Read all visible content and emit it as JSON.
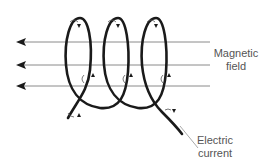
{
  "diagram": {
    "type": "solenoid-magnetic-field",
    "labels": {
      "magnetic_field": [
        "Magnetic",
        "field"
      ],
      "electric_current": [
        "Electric",
        "current"
      ]
    },
    "field_lines": 3,
    "field_direction": "left",
    "coil_turns": 3,
    "colors": {
      "wire": "#1a1a1a",
      "field_line": "#8a8a8a",
      "label_text": "#555555",
      "leader_line": "#aaaaaa"
    }
  }
}
